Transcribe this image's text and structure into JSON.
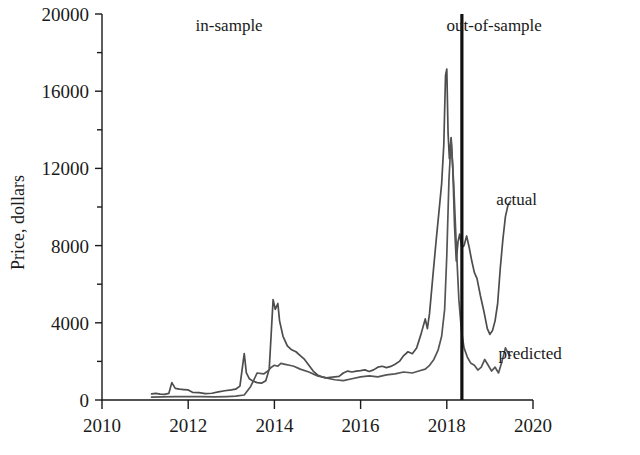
{
  "chart_data": {
    "type": "line",
    "title": "",
    "xlabel": "",
    "ylabel": "Price, dollars",
    "xlim": [
      2010,
      2020
    ],
    "ylim": [
      0,
      20000
    ],
    "x_ticks": [
      2010,
      2012,
      2014,
      2016,
      2018,
      2020
    ],
    "x_tick_labels": [
      "2010",
      "2012",
      "2014",
      "2016",
      "2018",
      "2020"
    ],
    "y_ticks": [
      0,
      4000,
      8000,
      12000,
      16000,
      20000
    ],
    "y_tick_labels": [
      "0",
      "4000",
      "8000",
      "12000",
      "16000",
      "20000"
    ],
    "y_minor_ticks": [
      2000,
      6000,
      10000,
      14000,
      18000
    ],
    "grid": false,
    "legend_position": "inline-right",
    "annotations": [
      {
        "text": "in-sample",
        "x": 2012.95,
        "y": 19100,
        "anchor": "middle"
      },
      {
        "text": "out-of-sample",
        "x": 2019.1,
        "y": 19100,
        "anchor": "middle"
      }
    ],
    "split_line": {
      "x": 2018.35,
      "label": "in-sample / out-of-sample split"
    },
    "series": [
      {
        "name": "actual",
        "color": "#4d4d4d",
        "width": 1.7,
        "label_x": 2019.15,
        "label_y": 10100,
        "x": [
          2011.15,
          2011.25,
          2011.35,
          2011.45,
          2011.55,
          2011.62,
          2011.7,
          2011.8,
          2011.9,
          2012.0,
          2012.1,
          2012.25,
          2012.4,
          2012.55,
          2012.7,
          2012.85,
          2013.0,
          2013.1,
          2013.2,
          2013.3,
          2013.35,
          2013.42,
          2013.5,
          2013.6,
          2013.7,
          2013.8,
          2013.88,
          2013.93,
          2013.97,
          2014.02,
          2014.08,
          2014.12,
          2014.2,
          2014.3,
          2014.4,
          2014.5,
          2014.6,
          2014.7,
          2014.8,
          2014.9,
          2015.0,
          2015.1,
          2015.2,
          2015.3,
          2015.4,
          2015.5,
          2015.6,
          2015.7,
          2015.8,
          2015.9,
          2016.0,
          2016.1,
          2016.2,
          2016.3,
          2016.4,
          2016.5,
          2016.6,
          2016.7,
          2016.8,
          2016.9,
          2017.0,
          2017.1,
          2017.2,
          2017.3,
          2017.4,
          2017.5,
          2017.55,
          2017.6,
          2017.68,
          2017.75,
          2017.82,
          2017.88,
          2017.93,
          2017.97,
          2018.0,
          2018.03,
          2018.06,
          2018.1,
          2018.14,
          2018.18,
          2018.22,
          2018.26,
          2018.3,
          2018.35,
          2018.4,
          2018.46,
          2018.52,
          2018.58,
          2018.64,
          2018.7,
          2018.78,
          2018.86,
          2018.94,
          2019.0,
          2019.06,
          2019.12,
          2019.18,
          2019.24,
          2019.3,
          2019.36,
          2019.42,
          2019.48
        ],
        "y": [
          320,
          340,
          300,
          290,
          340,
          900,
          600,
          560,
          540,
          520,
          400,
          380,
          330,
          350,
          420,
          480,
          520,
          560,
          720,
          2400,
          1400,
          1100,
          980,
          900,
          870,
          1000,
          1600,
          3600,
          5200,
          4700,
          5000,
          4100,
          3300,
          2800,
          2600,
          2500,
          2300,
          2100,
          1800,
          1500,
          1300,
          1200,
          1150,
          1180,
          1200,
          1220,
          1400,
          1500,
          1450,
          1500,
          1520,
          1560,
          1480,
          1560,
          1700,
          1750,
          1680,
          1740,
          1850,
          2000,
          2300,
          2500,
          2400,
          2700,
          3400,
          4200,
          3700,
          4500,
          6500,
          8200,
          9800,
          11200,
          13200,
          16800,
          17150,
          13800,
          12500,
          13600,
          12000,
          9000,
          7200,
          8200,
          8600,
          7900,
          8000,
          8500,
          7900,
          7200,
          6600,
          6300,
          5400,
          4600,
          3700,
          3400,
          3600,
          4100,
          5000,
          6800,
          8300,
          9500,
          10100,
          10300
        ]
      },
      {
        "name": "predicted",
        "color": "#555555",
        "width": 1.7,
        "label_x": 2019.2,
        "label_y": 2150,
        "x": [
          2011.15,
          2011.4,
          2011.7,
          2012.0,
          2012.3,
          2012.6,
          2012.9,
          2013.1,
          2013.3,
          2013.45,
          2013.6,
          2013.75,
          2013.85,
          2013.93,
          2014.0,
          2014.08,
          2014.15,
          2014.25,
          2014.35,
          2014.45,
          2014.6,
          2014.8,
          2015.0,
          2015.2,
          2015.4,
          2015.6,
          2015.8,
          2016.0,
          2016.2,
          2016.4,
          2016.6,
          2016.8,
          2017.0,
          2017.2,
          2017.35,
          2017.5,
          2017.6,
          2017.7,
          2017.8,
          2017.88,
          2017.95,
          2018.0,
          2018.05,
          2018.1,
          2018.16,
          2018.22,
          2018.28,
          2018.34,
          2018.4,
          2018.48,
          2018.56,
          2018.64,
          2018.72,
          2018.8,
          2018.88,
          2018.96,
          2019.04,
          2019.12,
          2019.2,
          2019.28,
          2019.36,
          2019.44,
          2019.48
        ],
        "y": [
          150,
          160,
          170,
          180,
          170,
          160,
          180,
          200,
          260,
          700,
          1400,
          1350,
          1500,
          1700,
          1800,
          1750,
          1900,
          1850,
          1800,
          1750,
          1600,
          1450,
          1250,
          1150,
          1050,
          1000,
          1100,
          1200,
          1250,
          1200,
          1300,
          1350,
          1450,
          1400,
          1500,
          1600,
          1800,
          2100,
          2600,
          3300,
          4700,
          7500,
          11400,
          13500,
          11200,
          8000,
          5200,
          3600,
          2700,
          2200,
          1900,
          1800,
          1550,
          1700,
          2100,
          1800,
          1500,
          1700,
          1400,
          2000,
          2700,
          2350,
          2300
        ]
      }
    ]
  },
  "axes": {
    "y_title": "Price, dollars"
  }
}
